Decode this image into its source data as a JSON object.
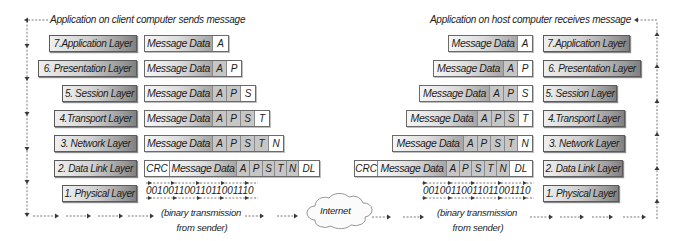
{
  "client": {
    "caption": "Application on client computer sends message",
    "layers": [
      "7.Application Layer",
      "6. Presentation Layer",
      "5. Session Layer",
      "4.Transport Layer",
      "3. Network Layer",
      "2. Data Link Layer",
      "1. Physical Layer"
    ]
  },
  "host": {
    "caption": "Application on host computer receives message",
    "layers": [
      "7.Application Layer",
      "6. Presentation Layer",
      "5. Session Layer",
      "4.Transport Layer",
      "3. Network Layer",
      "2. Data Link Layer",
      "1. Physical Layer"
    ]
  },
  "packet": {
    "message_data": "Message Data",
    "trailer": "CRC",
    "headers": {
      "application": "A",
      "presentation": "P",
      "session": "S",
      "transport": "T",
      "network": "N",
      "data_link": "DL"
    }
  },
  "transmission": {
    "bits": "00100110011011001110",
    "caption_line1": "(binary transmission",
    "caption_line2": "from sender)"
  },
  "network": {
    "label": "Internet"
  },
  "colors": {
    "layer_box_light": "#efefef",
    "layer_box_dark": "#808080",
    "old_header_cell": "#c6c6c6",
    "new_header_cell": "#ffffff",
    "arrow": "#4a4a4a"
  }
}
